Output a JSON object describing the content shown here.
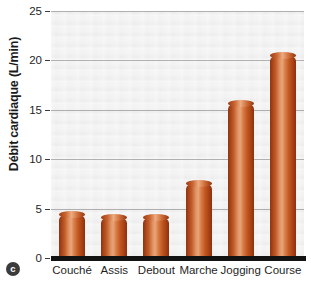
{
  "panel": {
    "badge_label": "c"
  },
  "chart_data": {
    "type": "bar",
    "title": "",
    "subtitle": "",
    "xlabel": "",
    "ylabel": "Débit cardiaque (L/min)",
    "categories": [
      "Couché",
      "Assis",
      "Debout",
      "Marche",
      "Jogging",
      "Course"
    ],
    "values": [
      4.5,
      4.2,
      4.2,
      7.6,
      15.7,
      20.5
    ],
    "ylim": [
      0,
      25
    ],
    "yticks": [
      0,
      5,
      10,
      15,
      20,
      25
    ],
    "ytick_labels": [
      "0",
      "5",
      "10",
      "15",
      "20",
      "25"
    ],
    "grid": true,
    "grid_axis": "y",
    "legend": false,
    "legend_position": "none",
    "bar_color": "#c25c28",
    "bar_color_dark": "#8f3310",
    "bar_color_light": "#e8a579",
    "plot_background": "#ececec",
    "axis_color": "#121212",
    "gridline_color": "#9a9a9a",
    "text_color": "#1f1f1f",
    "annotations": []
  }
}
